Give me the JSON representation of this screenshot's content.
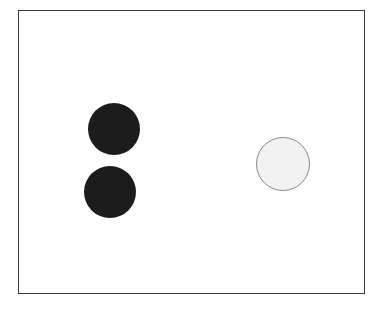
{
  "diagram": {
    "frame": {
      "stroke": "#3a3a3a",
      "fill": "#ffffff"
    },
    "circles": [
      {
        "id": "dark-top",
        "cx": 114,
        "cy": 129,
        "r": 26,
        "fill": "#1c1c1c",
        "stroke": "#1c1c1c"
      },
      {
        "id": "dark-bottom",
        "cx": 110,
        "cy": 192,
        "r": 26,
        "fill": "#1c1c1c",
        "stroke": "#1c1c1c"
      },
      {
        "id": "light-right",
        "cx": 283,
        "cy": 164,
        "r": 27,
        "fill": "#f2f2f2",
        "stroke": "#8a8a8a"
      }
    ]
  }
}
